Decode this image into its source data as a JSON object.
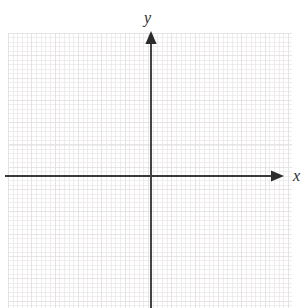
{
  "figure": {
    "type": "coordinate-plane",
    "title": "",
    "background_color": "#ffffff",
    "width": 308,
    "height": 308
  },
  "grid": {
    "name": "graph-paper-grid",
    "visible": true,
    "major_color": "#eceaea",
    "minor_color": "#f6f5f5",
    "major_spacing_x": 23.33,
    "major_spacing_y": 22.3,
    "minor_per_major": 5,
    "left": 8,
    "top": 33,
    "width": 284,
    "height": 275
  },
  "axes": {
    "color": "#3a3a3a",
    "origin_x": 151,
    "origin_y": 176,
    "x_axis": {
      "label": "x",
      "start_x": 5,
      "end_x": 277,
      "y": 176,
      "arrow": "right"
    },
    "y_axis": {
      "label": "y",
      "start_y": 308,
      "end_y": 36,
      "x": 151,
      "arrow": "up"
    }
  },
  "chart_data": {
    "type": "scatter",
    "title": "",
    "xlabel": "x",
    "ylabel": "y",
    "series": [],
    "x": [],
    "values": [],
    "xlim": [
      -6,
      6
    ],
    "ylim": [
      -6,
      6
    ],
    "grid": true,
    "legend": "none",
    "annotations": []
  }
}
